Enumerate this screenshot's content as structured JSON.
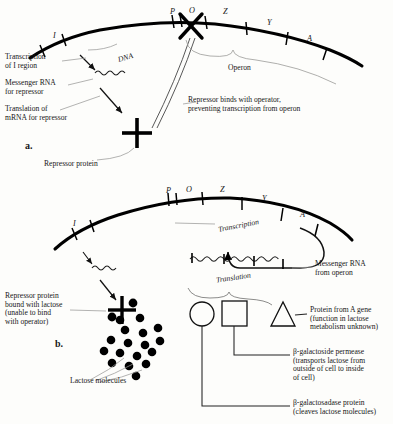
{
  "figure": {
    "panels": [
      {
        "id": "a",
        "marker": "a."
      },
      {
        "id": "b",
        "marker": "b."
      }
    ]
  },
  "panel_a": {
    "marker": "a.",
    "gene_labels": [
      {
        "name": "I",
        "text": "I"
      },
      {
        "name": "P",
        "text": "P"
      },
      {
        "name": "O",
        "text": "O"
      },
      {
        "name": "Z",
        "text": "Z"
      },
      {
        "name": "Y",
        "text": "Y"
      },
      {
        "name": "A",
        "text": "A"
      }
    ],
    "dna_label": "DNA",
    "operon_label": "Operon",
    "annotations": {
      "transcription_i": "Transcription\nof I region",
      "messenger_rna": "Messenger RNA\nfor repressor",
      "translation": "Translation of\nmRNA for repressor",
      "repressor_binds": "Repressor binds with operator,\npreventing transcription from operon",
      "repressor_protein": "Repressor protein"
    }
  },
  "panel_b": {
    "marker": "b.",
    "gene_labels": [
      {
        "name": "I",
        "text": "I"
      },
      {
        "name": "P",
        "text": "P"
      },
      {
        "name": "O",
        "text": "O"
      },
      {
        "name": "Z",
        "text": "Z"
      },
      {
        "name": "Y",
        "text": "Y"
      },
      {
        "name": "A",
        "text": "A"
      }
    ],
    "annotations": {
      "transcription": "Transcription",
      "translation": "Translation",
      "messenger_rna": "Messenger RNA\nfrom operon",
      "repressor_lactose": "Repressor protein\nbound with lactose\n(unable to bind\nwith operator)",
      "lactose_molecules": "Lactose molecules",
      "protein_a": "Protein from A gene\n(function in lactose\nmetabolism unknown)",
      "permease": "β-galactoside permease\n(transports lactose from\noutside of cell to inside\nof cell)",
      "galactosidase": "β-galactosadase protein\n(cleaves lactose molecules)"
    },
    "protein_shapes": [
      {
        "name": "circle",
        "represents": "β-galactosadase protein"
      },
      {
        "name": "square",
        "represents": "β-galactoside permease"
      },
      {
        "name": "triangle",
        "represents": "Protein from A gene"
      }
    ],
    "lactose_count": 17
  },
  "colors": {
    "dna": "#000000",
    "text": "#171717",
    "leader": "#8a8a88",
    "background": "#fdfdfb"
  }
}
